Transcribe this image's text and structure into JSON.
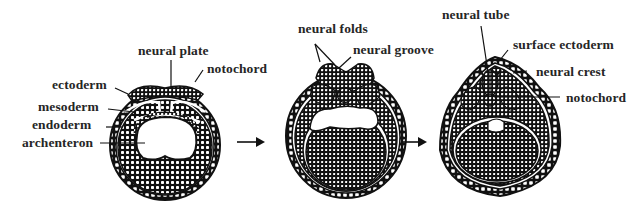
{
  "diagram": {
    "colors": {
      "ink": "#111111",
      "background": "#ffffff",
      "label": "#262626"
    },
    "stages": [
      {
        "id": "stage-1",
        "labels": {
          "neural_plate": "neural plate",
          "notochord": "notochord",
          "ectoderm": "ectoderm",
          "mesoderm": "mesoderm",
          "endoderm": "endoderm",
          "archenteron": "archenteron"
        }
      },
      {
        "id": "stage-2",
        "labels": {
          "neural_folds": "neural folds",
          "neural_groove": "neural groove"
        }
      },
      {
        "id": "stage-3",
        "labels": {
          "neural_tube": "neural tube",
          "surface_ectoderm": "surface ectoderm",
          "neural_crest": "neural crest",
          "notochord": "notochord"
        }
      }
    ],
    "arrows": [
      {
        "from": "stage-1",
        "to": "stage-2",
        "icon": "right-arrow-icon"
      },
      {
        "from": "stage-2",
        "to": "stage-3",
        "icon": "right-arrow-icon"
      }
    ]
  }
}
